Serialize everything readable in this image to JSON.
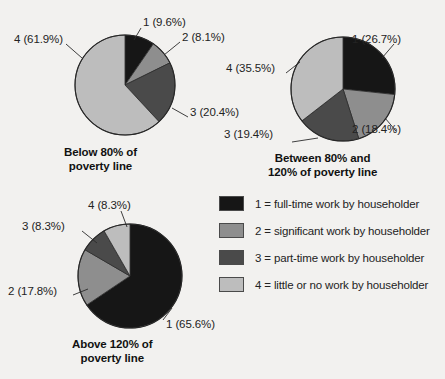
{
  "figure": {
    "background": "#f2f1ef",
    "width": 445,
    "height": 379
  },
  "chart_data": [
    {
      "type": "pie",
      "title": "Below 80% of poverty line",
      "title_lines": [
        "Below 80% of",
        "poverty line"
      ],
      "categories": [
        "1",
        "2",
        "3",
        "4"
      ],
      "values": [
        9.6,
        8.1,
        20.4,
        61.9
      ],
      "labels": [
        "1 (9.6%)",
        "2 (8.1%)",
        "3 (20.4%)",
        "4 (61.9%)"
      ],
      "colors": [
        "#161616",
        "#8e8e8e",
        "#4a4a4a",
        "#bdbdbd"
      ],
      "start_angle": 0,
      "center": [
        125,
        85
      ],
      "radius": 50
    },
    {
      "type": "pie",
      "title": "Between 80% and 120% of poverty line",
      "title_lines": [
        "Between 80% and",
        "120% of poverty line"
      ],
      "categories": [
        "1",
        "2",
        "3",
        "4"
      ],
      "values": [
        26.7,
        18.4,
        19.4,
        35.5
      ],
      "labels": [
        "1 (26.7%)",
        "2 (18.4%)",
        "3 (19.4%)",
        "4 (35.5%)"
      ],
      "colors": [
        "#161616",
        "#8e8e8e",
        "#4a4a4a",
        "#bdbdbd"
      ],
      "start_angle": 0,
      "center": [
        343,
        89
      ],
      "radius": 52
    },
    {
      "type": "pie",
      "title": "Above 120% of poverty line",
      "title_lines": [
        "Above 120% of",
        "poverty line"
      ],
      "categories": [
        "1",
        "2",
        "3",
        "4"
      ],
      "values": [
        65.6,
        17.8,
        8.3,
        8.3
      ],
      "labels": [
        "1 (65.6%)",
        "2 (17.8%)",
        "3 (8.3%)",
        "4 (8.3%)"
      ],
      "colors": [
        "#161616",
        "#8e8e8e",
        "#4a4a4a",
        "#bdbdbd"
      ],
      "start_angle": 0,
      "center": [
        130,
        276
      ],
      "radius": 52
    }
  ],
  "charts": {
    "chart1": {
      "title_line1": "Below 80% of",
      "title_line2": "poverty line",
      "label1": "1 (9.6%)",
      "label2": "2 (8.1%)",
      "label3": "3 (20.4%)",
      "label4": "4 (61.9%)"
    },
    "chart2": {
      "title_line1": "Between 80% and",
      "title_line2": "120% of poverty line",
      "label1": "1 (26.7%)",
      "label2": "2 (18.4%)",
      "label3": "3 (19.4%)",
      "label4": "4 (35.5%)"
    },
    "chart3": {
      "title_line1": "Above 120% of",
      "title_line2": "poverty line",
      "label1": "1 (65.6%)",
      "label2": "2 (17.8%)",
      "label3": "3 (8.3%)",
      "label4": "4 (8.3%)"
    }
  },
  "legend": {
    "position": "bottom-right",
    "items": [
      {
        "key": "1",
        "text": "1 = full-time work by householder",
        "color": "#161616"
      },
      {
        "key": "2",
        "text": "2 = significant work by householder",
        "color": "#8e8e8e"
      },
      {
        "key": "3",
        "text": "3 = part-time work by householder",
        "color": "#4a4a4a"
      },
      {
        "key": "4",
        "text": "4 = little or no work by householder",
        "color": "#bdbdbd"
      }
    ]
  }
}
